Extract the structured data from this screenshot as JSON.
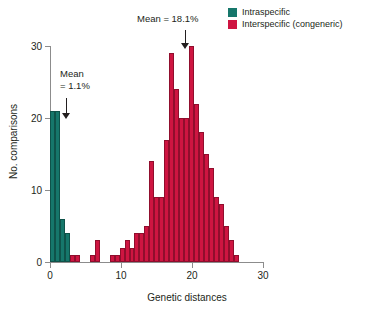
{
  "chart_data": {
    "type": "bar",
    "title": "",
    "subtitle": "",
    "xlabel": "Genetic distances",
    "ylabel": "No. comparisons",
    "xlim": [
      0,
      30
    ],
    "ylim": [
      0,
      30
    ],
    "xticks": [
      0,
      10,
      20,
      30
    ],
    "yticks": [
      0,
      10,
      20,
      30
    ],
    "grid": false,
    "bin_width": 0.7,
    "legend_position": "top-right",
    "colors": {
      "intraspecific": "#16776b",
      "interspecific": "#ce1541",
      "axis": "#8c8c8c",
      "text": "#231f20"
    },
    "legend": [
      {
        "label": "Intraspecific",
        "color": "#16776b"
      },
      {
        "label": "Interspecific (congeneric)",
        "color": "#ce1541"
      }
    ],
    "annotations": [
      {
        "id": "intra-mean",
        "text_line1": "Mean",
        "text_line2": "= 1.1%",
        "points_to_x": 1.1,
        "arrow": "down"
      },
      {
        "id": "inter-mean",
        "text_line1": "Mean = 18.1%",
        "text_line2": "",
        "points_to_x": 18.6,
        "arrow": "down"
      }
    ],
    "series": [
      {
        "name": "Intraspecific",
        "color": "#16776b",
        "bins": [
          {
            "x": 0.0,
            "value": 21
          },
          {
            "x": 0.7,
            "value": 21
          },
          {
            "x": 1.4,
            "value": 6
          },
          {
            "x": 2.1,
            "value": 4
          }
        ]
      },
      {
        "name": "Interspecific (congeneric)",
        "color": "#ce1541",
        "bins": [
          {
            "x": 2.8,
            "value": 1
          },
          {
            "x": 3.5,
            "value": 1
          },
          {
            "x": 5.6,
            "value": 1
          },
          {
            "x": 6.3,
            "value": 3
          },
          {
            "x": 8.4,
            "value": 1
          },
          {
            "x": 9.1,
            "value": 1
          },
          {
            "x": 9.8,
            "value": 2
          },
          {
            "x": 10.5,
            "value": 3
          },
          {
            "x": 11.2,
            "value": 2
          },
          {
            "x": 11.9,
            "value": 4
          },
          {
            "x": 12.6,
            "value": 4
          },
          {
            "x": 13.3,
            "value": 5
          },
          {
            "x": 14.0,
            "value": 14
          },
          {
            "x": 14.7,
            "value": 9
          },
          {
            "x": 15.4,
            "value": 9
          },
          {
            "x": 16.1,
            "value": 17
          },
          {
            "x": 16.8,
            "value": 29
          },
          {
            "x": 17.5,
            "value": 24
          },
          {
            "x": 18.2,
            "value": 20
          },
          {
            "x": 18.9,
            "value": 20
          },
          {
            "x": 19.6,
            "value": 30
          },
          {
            "x": 20.3,
            "value": 22
          },
          {
            "x": 21.0,
            "value": 18
          },
          {
            "x": 21.7,
            "value": 15
          },
          {
            "x": 22.4,
            "value": 13
          },
          {
            "x": 23.1,
            "value": 9
          },
          {
            "x": 23.8,
            "value": 8
          },
          {
            "x": 24.5,
            "value": 5
          },
          {
            "x": 25.2,
            "value": 3
          },
          {
            "x": 25.9,
            "value": 1
          }
        ]
      }
    ]
  }
}
